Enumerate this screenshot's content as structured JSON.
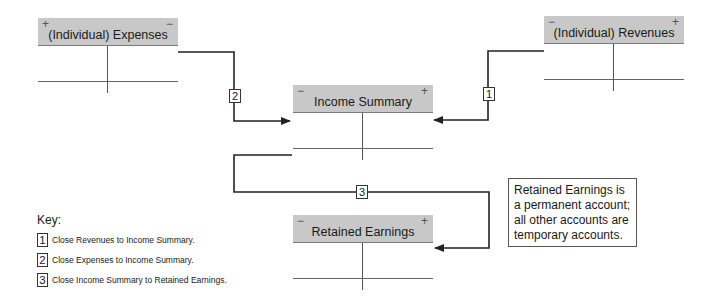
{
  "accounts": {
    "expenses": {
      "title": "(Individual) Expenses",
      "left_sign": "+",
      "right_sign": "−"
    },
    "revenues": {
      "title": "(Individual) Revenues",
      "left_sign": "−",
      "right_sign": "+"
    },
    "income_summary": {
      "title": "Income Summary",
      "left_sign": "−",
      "right_sign": "+"
    },
    "retained_earnings": {
      "title": "Retained Earnings",
      "left_sign": "−",
      "right_sign": "+"
    }
  },
  "steps": {
    "one": "1",
    "two": "2",
    "three": "3"
  },
  "note": {
    "text": "Retained Earnings is a permanent account; all other accounts are temporary accounts."
  },
  "key": {
    "title": "Key:",
    "items": [
      {
        "num": "1",
        "text": "Close Revenues to Income Summary."
      },
      {
        "num": "2",
        "text": "Close Expenses to Income Summary."
      },
      {
        "num": "3",
        "text": "Close Income Summary to Retained Earnings."
      }
    ]
  },
  "colors": {
    "header_fill": "#c8c8c8",
    "line": "#333333"
  }
}
